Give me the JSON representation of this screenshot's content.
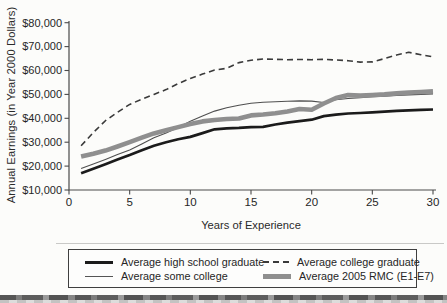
{
  "figure_type": "scanned line chart",
  "chart_data": {
    "type": "line",
    "title": "",
    "xlabel": "Years of Experience",
    "ylabel": "Annual Earnings (in Year 2000 Dollars)",
    "xlim": [
      0,
      30
    ],
    "ylim": [
      10000,
      80000
    ],
    "grid": false,
    "legend_position": "bottom-box",
    "x_tick_values": [
      0,
      5,
      10,
      15,
      20,
      25,
      30
    ],
    "x_tick_labels": [
      "0",
      "5",
      "10",
      "15",
      "20",
      "25",
      "30"
    ],
    "y_tick_values": [
      10000,
      20000,
      30000,
      40000,
      50000,
      60000,
      70000,
      80000
    ],
    "y_tick_labels": [
      "$10,000",
      "$20,000",
      "$30,000",
      "$40,000",
      "$50,000",
      "$60,000",
      "$70,000",
      "$80,000"
    ],
    "x": [
      1,
      2,
      3,
      4,
      5,
      6,
      7,
      8,
      9,
      10,
      11,
      12,
      13,
      14,
      15,
      16,
      17,
      18,
      19,
      20,
      21,
      22,
      23,
      24,
      25,
      26,
      27,
      28,
      29,
      30
    ],
    "series": [
      {
        "name": "Average some college",
        "style": "thin-solid",
        "color": "#4f4f4f",
        "width": 1.1,
        "values": [
          19000,
          20900,
          22800,
          24800,
          26700,
          29300,
          31900,
          33900,
          36200,
          38800,
          41000,
          43000,
          44400,
          45500,
          46300,
          46700,
          46900,
          47100,
          47300,
          47200,
          46600,
          47800,
          48300,
          48600,
          49000,
          49300,
          49600,
          49800,
          50000,
          50200
        ]
      },
      {
        "name": "Average college graduate",
        "style": "dashed",
        "color": "#3a3a3a",
        "width": 1.6,
        "dash": "6 4",
        "values": [
          28500,
          34000,
          39000,
          42500,
          45800,
          48000,
          50000,
          52000,
          54500,
          56700,
          58500,
          60200,
          60900,
          63300,
          64300,
          64800,
          64700,
          64500,
          64600,
          64500,
          64700,
          64400,
          64100,
          63500,
          63600,
          65000,
          66500,
          67600,
          66600,
          65700
        ]
      },
      {
        "name": "Average 2005 RMC (E1-E7)",
        "style": "thick-gray",
        "color": "#8f8f8f",
        "width": 4.6,
        "values": [
          24000,
          25200,
          26500,
          28200,
          30000,
          31900,
          33700,
          35000,
          36300,
          37600,
          38700,
          39300,
          39700,
          39900,
          41200,
          41600,
          42100,
          42900,
          43900,
          43600,
          46200,
          48500,
          49700,
          49500,
          49700,
          50000,
          50400,
          50800,
          51000,
          51300
        ]
      },
      {
        "name": "Average high school graduate",
        "style": "thick-solid",
        "color": "#1b1b1b",
        "width": 2.7,
        "values": [
          17000,
          18900,
          20800,
          22700,
          24600,
          26600,
          28500,
          30000,
          31200,
          32200,
          33800,
          35400,
          35800,
          36000,
          36300,
          36400,
          37400,
          38200,
          38800,
          39400,
          40900,
          41500,
          42000,
          42200,
          42500,
          42800,
          43100,
          43300,
          43500,
          43700
        ]
      }
    ]
  },
  "legend": {
    "order": [
      3,
      1,
      0,
      2
    ]
  },
  "axis_color": "#4a4a4a",
  "tick_label_color": "#262626"
}
